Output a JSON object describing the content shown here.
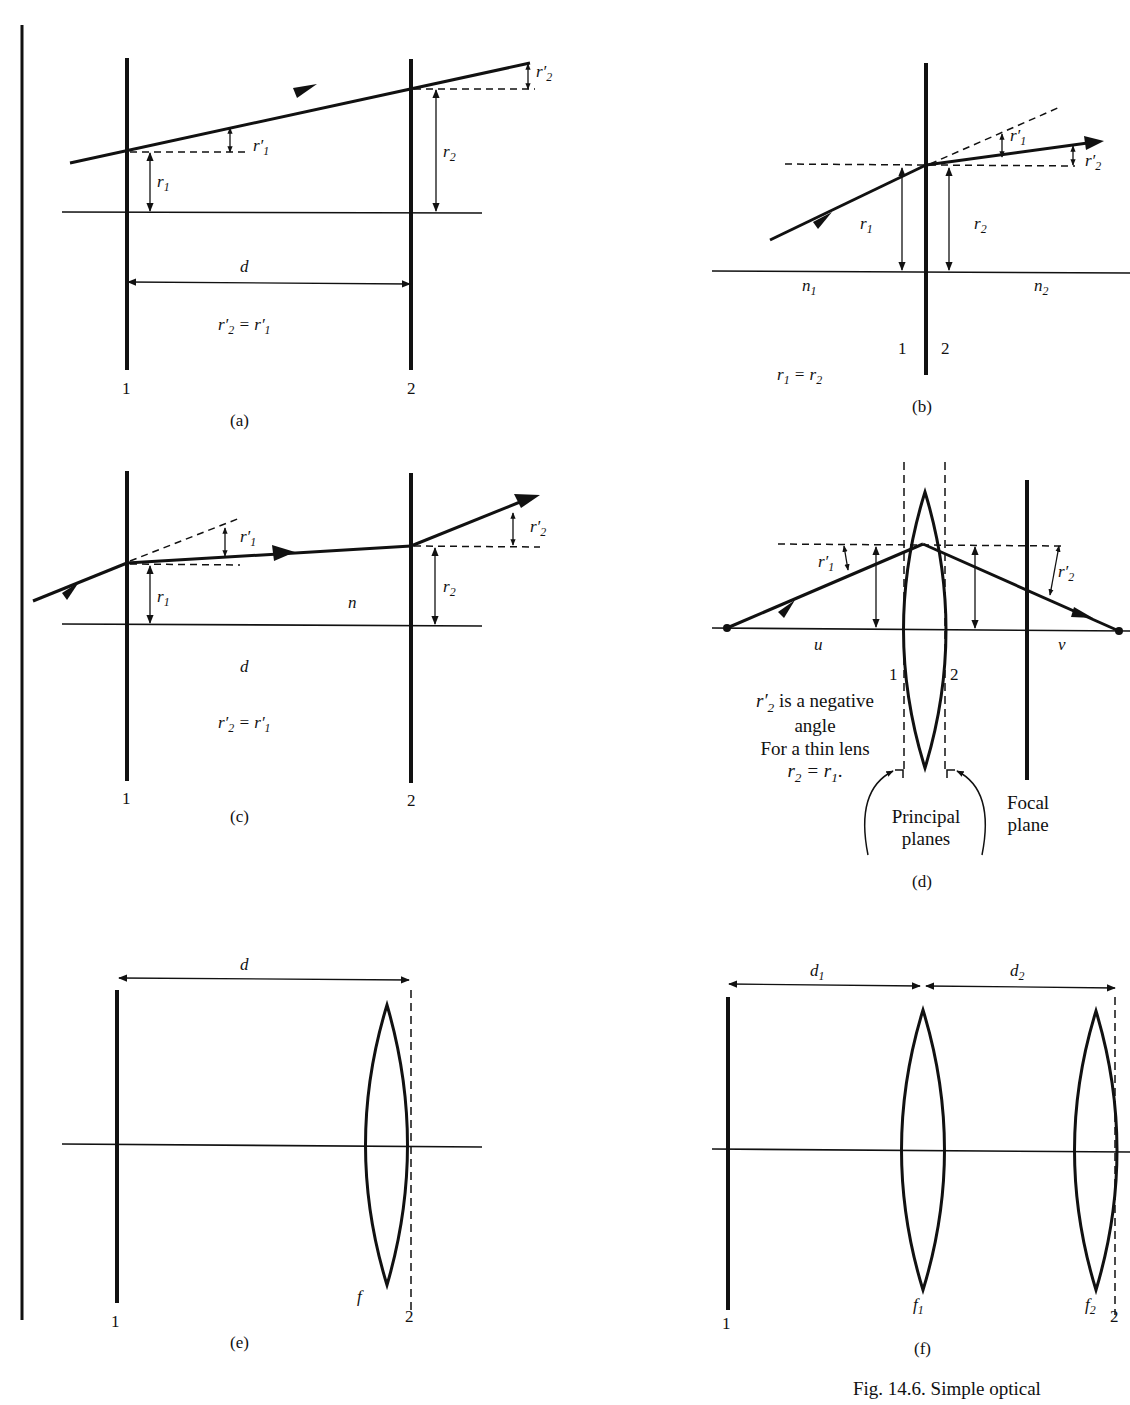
{
  "figure": {
    "caption": "Fig. 14.6.   Simple optical"
  },
  "panels": {
    "a": {
      "label": "(a)",
      "plane1": "1",
      "plane2": "2",
      "r1": "r",
      "r1_sub": "1",
      "r1p": "r′",
      "r1p_sub": "1",
      "r2": "r",
      "r2_sub": "2",
      "r2p": "r′",
      "r2p_sub": "2",
      "distance": "d",
      "equation_lhs": "r′",
      "equation_lhs_sub": "2",
      "equation_mid": " = r′",
      "equation_rhs_sub": "1"
    },
    "b": {
      "label": "(b)",
      "plane1": "1",
      "plane2": "2",
      "r1": "r",
      "r1_sub": "1",
      "r2": "r",
      "r2_sub": "2",
      "r1p": "r′",
      "r1p_sub": "1",
      "r2p": "r′",
      "r2p_sub": "2",
      "n1": "n",
      "n1_sub": "1",
      "n2": "n",
      "n2_sub": "2",
      "equation_lhs": "r",
      "equation_lhs_sub": "1",
      "equation_mid": " = r",
      "equation_rhs_sub": "2"
    },
    "c": {
      "label": "(c)",
      "plane1": "1",
      "plane2": "2",
      "r1": "r",
      "r1_sub": "1",
      "r1p": "r′",
      "r1p_sub": "1",
      "r2": "r",
      "r2_sub": "2",
      "r2p": "r′",
      "r2p_sub": "2",
      "medium": "n",
      "distance": "d",
      "equation_lhs": "r′",
      "equation_lhs_sub": "2",
      "equation_mid": " = r′",
      "equation_rhs_sub": "1"
    },
    "d": {
      "label": "(d)",
      "plane1": "1",
      "plane2": "2",
      "r1p": "r′",
      "r1p_sub": "1",
      "r2p": "r′",
      "r2p_sub": "2",
      "object_distance": "u",
      "image_distance": "v",
      "note_line1_sym": "r′",
      "note_line1_sub": "2",
      "note_line1_rest": " is a negative",
      "note_line2": "angle",
      "note_line3": "For a thin lens",
      "note_line4_a": "r",
      "note_line4_a_sub": "2",
      "note_line4_mid": " = r",
      "note_line4_b_sub": "1",
      "note_line4_end": ".",
      "principal_planes_line1": "Principal",
      "principal_planes_line2": "planes",
      "focal_plane_line1": "Focal",
      "focal_plane_line2": "plane"
    },
    "e": {
      "label": "(e)",
      "plane1": "1",
      "plane2": "2",
      "distance": "d",
      "focal": "f"
    },
    "f": {
      "label": "(f)",
      "plane1": "1",
      "plane2": "2",
      "d1": "d",
      "d1_sub": "1",
      "d2": "d",
      "d2_sub": "2",
      "f1": "f",
      "f1_sub": "1",
      "f2": "f",
      "f2_sub": "2"
    }
  },
  "colors": {
    "ink": "#111111",
    "paper": "#ffffff"
  }
}
